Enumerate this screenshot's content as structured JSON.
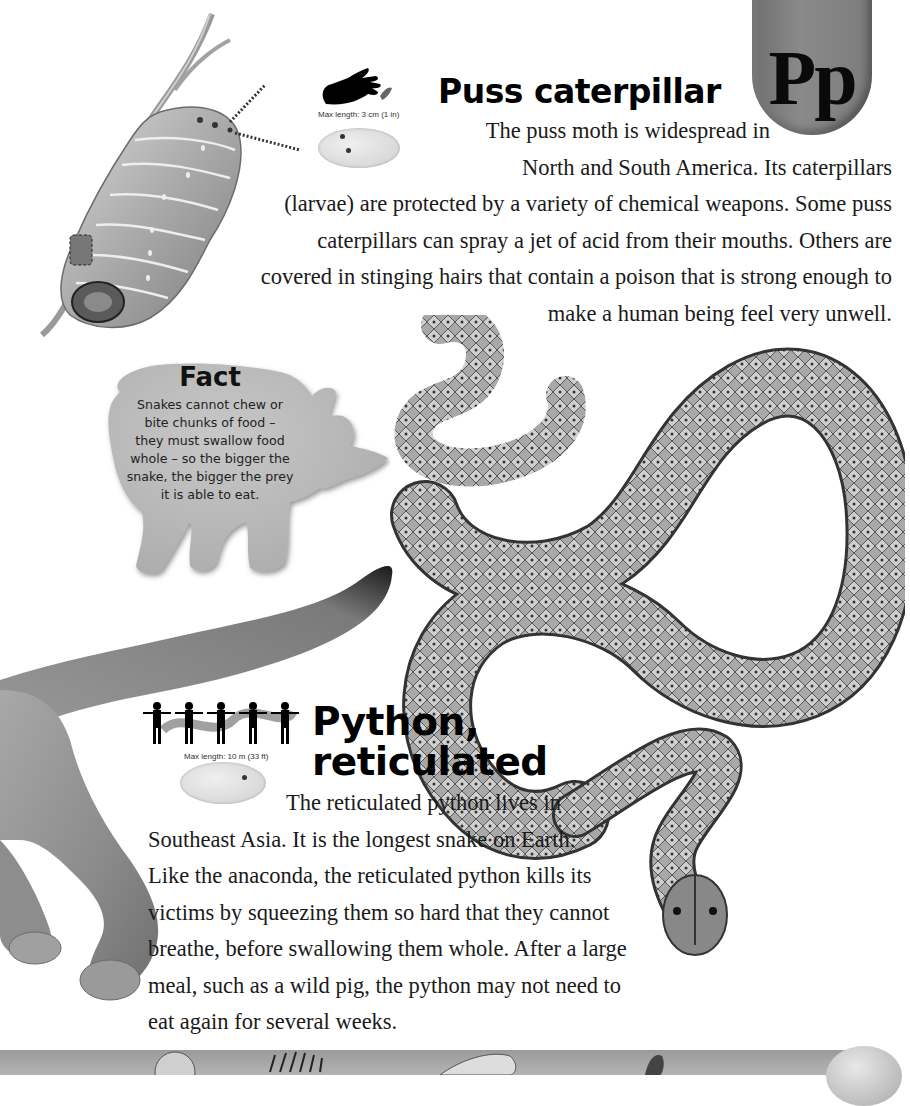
{
  "page": {
    "letter_tab": "Pp"
  },
  "entries": [
    {
      "id": "puss-caterpillar",
      "title": "Puss caterpillar",
      "max_length": "Max length: 3 cm (1 in)",
      "scale_icon": "hand-icon",
      "map_icon": "world-map-icon",
      "body_lines": [
        "The puss moth is widespread in",
        "North and South America. Its caterpillars",
        "(larvae) are protected by a variety of chemical weapons. Some puss",
        "caterpillars can spray a jet of acid from their mouths. Others are",
        "covered in stinging hairs that contain a poison that is strong enough to",
        "make a human being feel very unwell."
      ]
    },
    {
      "id": "python-reticulated",
      "title_lines": [
        "Python,",
        "reticulated"
      ],
      "max_length": "Max length: 10 m (33 ft)",
      "scale_icon": "human-figures-icon",
      "map_icon": "world-map-icon",
      "body_lines": [
        "The reticulated python lives in",
        "Southeast Asia. It is the longest snake on Earth.",
        "Like the anaconda, the reticulated python kills its",
        "victims by squeezing them so hard that they cannot",
        "breathe, before swallowing them whole. After a large",
        "meal, such as a wild pig, the python may not need to",
        "eat again for several weeks."
      ]
    }
  ],
  "fact_box": {
    "title": "Fact",
    "shape": "rhinoceros",
    "lines": [
      "Snakes cannot chew or",
      "bite chunks of food –",
      "they must swallow food",
      "whole – so the bigger the",
      "snake, the bigger the prey",
      "it is able to eat."
    ]
  },
  "illustrations": [
    {
      "name": "puss-caterpillar-illustration"
    },
    {
      "name": "reticulated-python-illustration"
    },
    {
      "name": "big-cat-tail-and-leg-illustration"
    }
  ],
  "colors": {
    "tab_gray": "#7c7c7c",
    "fact_gray": "#b9b9b9",
    "text": "#1a1a1a"
  }
}
